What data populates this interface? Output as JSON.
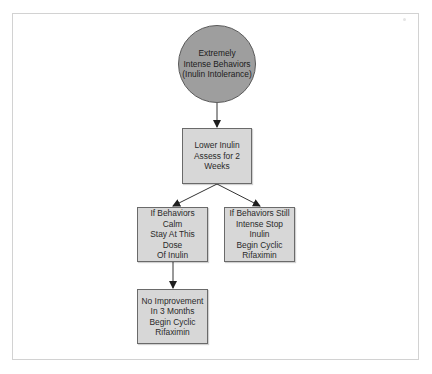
{
  "diagram": {
    "type": "flowchart",
    "nodes": [
      {
        "id": "start",
        "shape": "circle",
        "label": "Extremely\nIntense Behaviors\n(Inulin Intolerance)",
        "fill": "#9e9e9e"
      },
      {
        "id": "lower",
        "shape": "rect",
        "label": "Lower Inulin\nAssess for 2\nWeeks",
        "fill": "#d7d7d7"
      },
      {
        "id": "calm",
        "shape": "rect",
        "label": "If Behaviors Calm\nStay At This Dose\nOf Inulin",
        "fill": "#d7d7d7"
      },
      {
        "id": "still",
        "shape": "rect",
        "label": "If Behaviors Still\nIntense Stop Inulin\nBegin Cyclic\nRifaximin",
        "fill": "#d7d7d7"
      },
      {
        "id": "noimprove",
        "shape": "rect",
        "label": "No Improvement\nIn 3 Months\nBegin Cyclic\nRifaximin",
        "fill": "#d7d7d7"
      }
    ],
    "edges": [
      {
        "from": "start",
        "to": "lower"
      },
      {
        "from": "lower",
        "to": "calm"
      },
      {
        "from": "lower",
        "to": "still"
      },
      {
        "from": "calm",
        "to": "noimprove"
      }
    ]
  }
}
